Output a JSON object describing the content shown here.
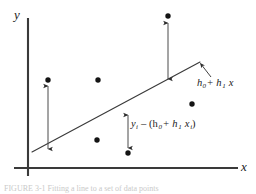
{
  "figure": {
    "type": "scatter-with-regression-line",
    "axes": {
      "y_label": "y",
      "x_label": "x",
      "y_axis": {
        "x": 28,
        "y_top": 18,
        "y_bottom": 176
      },
      "x_axis": {
        "y": 168,
        "x_left": 14,
        "x_right": 238
      }
    },
    "regression_line": {
      "label_text": "h",
      "label_sub0": "0",
      "label_plus": "+ h",
      "label_sub1": "1",
      "label_x": " x",
      "x1": 32,
      "y1": 152,
      "x2": 200,
      "y2": 62
    },
    "residual": {
      "label_y": "y",
      "label_y_sub": "i",
      "label_minus": " – (h",
      "label_sub0": "0",
      "label_plus": "+ h",
      "label_sub1": "1",
      "label_x": " x",
      "label_x_sub": "i",
      "label_close": ")"
    },
    "data_points": [
      {
        "name": "point-upper-left",
        "cx": 48,
        "cy": 80,
        "r": 2.6
      },
      {
        "name": "point-upper-mid",
        "cx": 98,
        "cy": 80,
        "r": 2.6
      },
      {
        "name": "point-top-right",
        "cx": 168,
        "cy": 16,
        "r": 2.6
      },
      {
        "name": "point-lower-mid",
        "cx": 97,
        "cy": 140,
        "r": 2.6
      },
      {
        "name": "point-right",
        "cx": 192,
        "cy": 104,
        "r": 2.6
      },
      {
        "name": "point-residual-end",
        "cx": 128,
        "cy": 153,
        "r": 2.6
      }
    ],
    "residual_arrows": [
      {
        "name": "residual-arrow-left",
        "x": 48,
        "y_top": 85,
        "y_bottom": 150,
        "double": true
      },
      {
        "name": "residual-arrow-top",
        "x": 168,
        "y_top": 22,
        "y_bottom": 80,
        "double": true
      },
      {
        "name": "residual-arrow-labeled",
        "x": 128,
        "y_top": 114,
        "y_bottom": 149,
        "double": true
      }
    ],
    "pointer_arrow": {
      "name": "line-eq-pointer",
      "x1": 210,
      "y1": 76,
      "x2": 200,
      "y2": 64
    },
    "caption": "FIGURE 3-1   Fitting a line to a set of data points",
    "colors": {
      "ink": "#1a1a1a",
      "axis": "#333333",
      "line": "#3a3a3a",
      "caption": "#c9c9c9",
      "background": "#ffffff"
    }
  }
}
